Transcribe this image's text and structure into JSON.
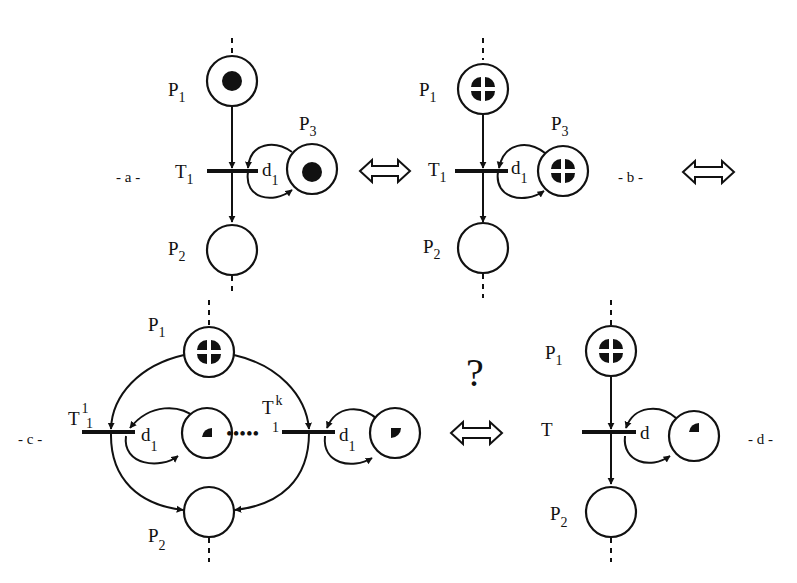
{
  "figure": {
    "equivalence_symbol": "⟺",
    "question_mark": "?",
    "ellipsis": "•••••"
  },
  "panels": {
    "a": {
      "label": "- a -",
      "places": {
        "p1": "P",
        "p1_sub": "1",
        "p2": "P",
        "p2_sub": "2",
        "p3": "P",
        "p3_sub": "3"
      },
      "transition": "T",
      "transition_sub": "1",
      "delay": "d",
      "delay_sub": "1",
      "tokens": {
        "p1": "single-dot",
        "p3": "single-dot"
      }
    },
    "b": {
      "label": "- b -",
      "places": {
        "p1": "P",
        "p1_sub": "1",
        "p2": "P",
        "p2_sub": "2",
        "p3": "P",
        "p3_sub": "3"
      },
      "transition": "T",
      "transition_sub": "1",
      "delay": "d",
      "delay_sub": "1",
      "tokens": {
        "p1": "four-quarters",
        "p3": "four-quarters"
      }
    },
    "c": {
      "label": "- c -",
      "places": {
        "p1": "P",
        "p1_sub": "1",
        "p2": "P",
        "p2_sub": "2"
      },
      "transition_first": "T",
      "transition_first_sup": "1",
      "transition_first_sub": "1",
      "transition_last": "T",
      "transition_last_sup": "k",
      "transition_last_sub": "1",
      "delay": "d",
      "delay_sub": "1",
      "tokens": {
        "p1": "four-quarters",
        "loop_first": "quarter",
        "loop_last": "quarter"
      }
    },
    "d": {
      "label": "- d -",
      "places": {
        "p1": "P",
        "p1_sub": "1",
        "p2": "P",
        "p2_sub": "2"
      },
      "transition": "T",
      "delay": "d",
      "tokens": {
        "p1": "four-quarters",
        "loop": "quarter"
      }
    }
  },
  "colors": {
    "ink": "#111111",
    "background": "#ffffff"
  }
}
